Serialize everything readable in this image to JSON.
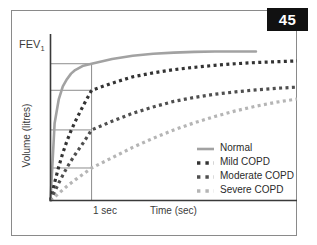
{
  "figure": {
    "number_badge": "45",
    "fev_label": "FEV",
    "fev_subscript": "1",
    "ylabel": "Volume (litres)",
    "xlabel": "Time (sec)",
    "onesec_label": "1 sec",
    "badge_bg": "#111111",
    "badge_fg": "#ffffff",
    "frame_color": "#8a8a8a",
    "axis_color": "#3a3a3a",
    "guide_color": "#8d8d8d"
  },
  "chart_data": {
    "type": "line",
    "xlabel": "Time (sec)",
    "ylabel": "Volume (litres)",
    "xlim": [
      0,
      6
    ],
    "ylim": [
      0,
      4.2
    ],
    "grid": false,
    "legend_position": "inside-lower-right",
    "annotations": [
      {
        "text": "FEV",
        "subscript": "1",
        "kind": "y-axis-tick",
        "y": 3.45
      },
      {
        "text": "1 sec",
        "kind": "x-axis-tick",
        "x": 1.0
      }
    ],
    "reference_lines": {
      "vertical_at_x": 1.0,
      "horizontal_at_y": [
        3.45,
        2.78,
        1.78,
        0.82
      ]
    },
    "x": [
      0,
      0.1,
      0.2,
      0.3,
      0.4,
      0.5,
      0.6,
      0.8,
      1.0,
      1.5,
      2.0,
      2.5,
      3.0,
      3.5,
      4.0,
      4.5,
      5.0,
      5.5,
      6.0
    ],
    "series": [
      {
        "name": "Normal",
        "color": "#a2a2a2",
        "style": "solid",
        "fev1": 3.45,
        "values": [
          0,
          1.95,
          2.55,
          2.88,
          3.06,
          3.2,
          3.29,
          3.4,
          3.45,
          3.57,
          3.65,
          3.7,
          3.73,
          3.75,
          3.76,
          3.76,
          3.76,
          null,
          null
        ]
      },
      {
        "name": "Mild COPD",
        "color": "#333333",
        "style": "dashed",
        "fev1": 2.78,
        "values": [
          0,
          0.45,
          0.85,
          1.2,
          1.5,
          1.76,
          1.99,
          2.4,
          2.78,
          2.96,
          3.12,
          3.22,
          3.3,
          3.36,
          3.41,
          3.45,
          3.48,
          3.5,
          3.52
        ]
      },
      {
        "name": "Moderate COPD",
        "color": "#4f4f4f",
        "style": "dashed",
        "fev1": 1.78,
        "values": [
          0,
          0.22,
          0.44,
          0.64,
          0.83,
          1.0,
          1.16,
          1.46,
          1.78,
          2.0,
          2.2,
          2.36,
          2.5,
          2.6,
          2.68,
          2.74,
          2.79,
          2.83,
          2.86
        ]
      },
      {
        "name": "Severe COPD",
        "color": "#b5b5b5",
        "style": "dashed",
        "fev1": 0.82,
        "values": [
          0,
          0.09,
          0.18,
          0.27,
          0.36,
          0.44,
          0.52,
          0.67,
          0.82,
          1.08,
          1.34,
          1.57,
          1.78,
          1.96,
          2.12,
          2.26,
          2.38,
          2.48,
          2.56
        ]
      }
    ]
  },
  "legend": {
    "items": [
      {
        "label": "Normal",
        "color": "#a2a2a2",
        "style": "solid"
      },
      {
        "label": "Mild COPD",
        "color": "#333333",
        "style": "dashed"
      },
      {
        "label": "Moderate COPD",
        "color": "#4f4f4f",
        "style": "dashed"
      },
      {
        "label": "Severe COPD",
        "color": "#b5b5b5",
        "style": "dashed"
      }
    ]
  }
}
